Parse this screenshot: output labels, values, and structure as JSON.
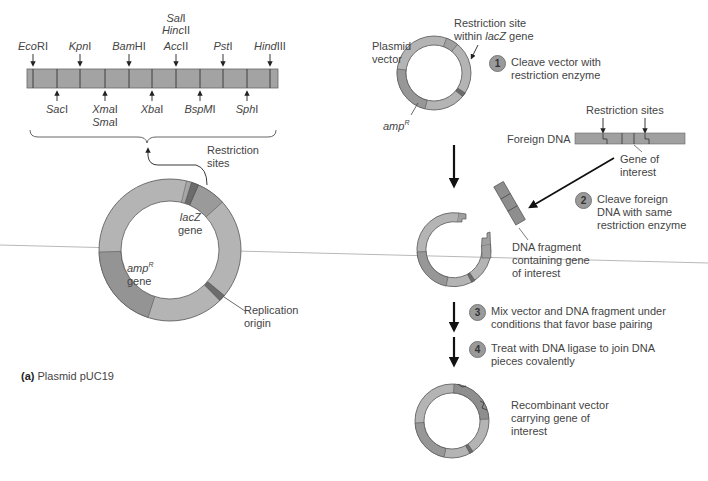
{
  "panel_a": {
    "caption_letter": "(a)",
    "caption_text": "Plasmid pUC19",
    "mcs_sites_top": [
      {
        "name_italic": "Eco",
        "name_rest": "RI",
        "x": 33
      },
      {
        "name_italic": "Kpn",
        "name_rest": "I",
        "x": 80
      },
      {
        "name_italic": "Bam",
        "name_rest": "HI",
        "x": 129
      },
      {
        "name_italic": "Acc",
        "name_rest": "II",
        "x": 176
      },
      {
        "name_italic": "Pst",
        "name_rest": "I",
        "x": 223
      },
      {
        "name_italic": "Hind",
        "name_rest": "III",
        "x": 270
      }
    ],
    "mcs_sites_top_stack": [
      {
        "name_italic": "Sal",
        "name_rest": "I"
      },
      {
        "name_italic": "Hinc",
        "name_rest": "II"
      }
    ],
    "mcs_sites_bottom": [
      {
        "name_italic": "Sac",
        "name_rest": "I",
        "x": 57
      },
      {
        "name_italic": "Xma",
        "name_rest": "I",
        "x": 105
      },
      {
        "name_italic": "Xba",
        "name_rest": "I",
        "x": 152
      },
      {
        "name_italic": "BspM",
        "name_rest": "I",
        "x": 200
      },
      {
        "name_italic": "Sph",
        "name_rest": "I",
        "x": 247
      }
    ],
    "mcs_sites_bottom_stack": [
      {
        "name_italic": "Sma",
        "name_rest": "I"
      }
    ],
    "restriction_sites_label": [
      "Restriction",
      "sites"
    ],
    "lacz_label": {
      "italic": "lacZ",
      "rest": "gene"
    },
    "ampr_label": {
      "italic": "amp",
      "sup": "R",
      "rest": "gene"
    },
    "ori_label": [
      "Replication",
      "origin"
    ]
  },
  "panel_b": {
    "plasmid_vector_label": [
      "Plasmid",
      "vector"
    ],
    "restriction_site_lacz_label": {
      "line1": "Restriction site",
      "line2_pre": "within ",
      "line2_italic": "lacZ",
      "line2_post": " gene"
    },
    "ampr_label": {
      "italic": "amp",
      "sup": "R"
    },
    "foreign_dna_label": "Foreign DNA",
    "restriction_sites_label": "Restriction sites",
    "gene_of_interest_label": [
      "Gene of",
      "interest"
    ],
    "dna_fragment_label": [
      "DNA fragment",
      "containing gene",
      "of interest"
    ],
    "recombinant_label": [
      "Recombinant vector",
      "carrying gene of",
      "interest"
    ],
    "steps": [
      {
        "num": "1",
        "lines": [
          "Cleave vector with",
          "restriction enzyme"
        ]
      },
      {
        "num": "2",
        "lines": [
          "Cleave foreign",
          "DNA with same",
          "restriction enzyme"
        ]
      },
      {
        "num": "3",
        "lines": [
          "Mix vector and DNA fragment under",
          "conditions that favor base pairing"
        ]
      },
      {
        "num": "4",
        "lines": [
          "Treat with DNA ligase to join DNA",
          "pieces covalently"
        ]
      }
    ]
  },
  "colors": {
    "ring_light": "#b4b4b4",
    "ring_mid": "#9c9c9c",
    "ring_dark": "#8a8a8a",
    "outline": "#555555",
    "step_circle": "#9a9a9a",
    "stray_line": "#b8b8b8"
  }
}
